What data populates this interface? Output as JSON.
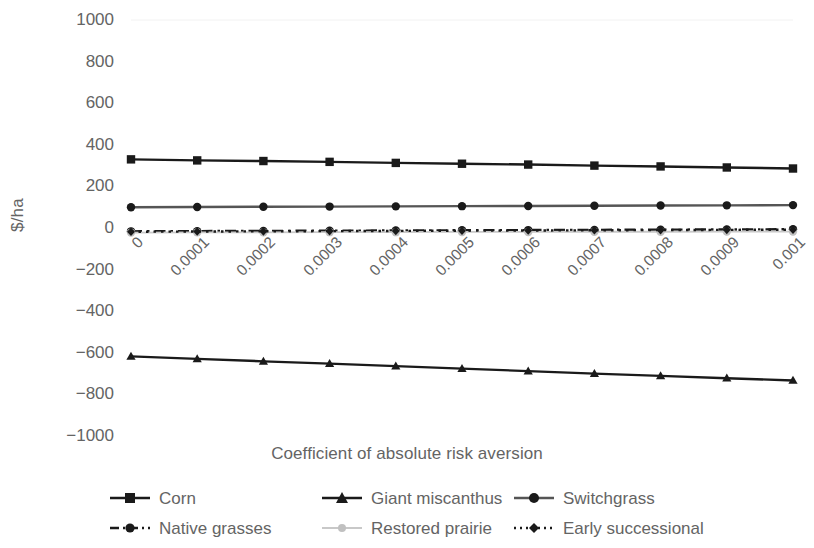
{
  "chart_data": {
    "type": "line",
    "title": "",
    "xlabel": "Coefficient of absolute risk aversion",
    "ylabel": "$/ha",
    "x": [
      0,
      0.0001,
      0.0002,
      0.0003,
      0.0004,
      0.0005,
      0.0006,
      0.0007,
      0.0008,
      0.0009,
      0.001
    ],
    "x_tick_labels": [
      "0",
      "0.0001",
      "0.0002",
      "0.0003",
      "0.0004",
      "0.0005",
      "0.0006",
      "0.0007",
      "0.0008",
      "0.0009",
      "0.001"
    ],
    "y_tick_labels": [
      "1000",
      "800",
      "600",
      "400",
      "200",
      "0",
      "-200",
      "-400",
      "-600",
      "-800",
      "-1000"
    ],
    "y_ticks": [
      1000,
      800,
      600,
      400,
      200,
      0,
      -200,
      -400,
      -600,
      -800,
      -1000
    ],
    "ylim": [
      -1000,
      1000
    ],
    "xlim": [
      0,
      0.001
    ],
    "grid": false,
    "legend_position": "bottom",
    "series": [
      {
        "name": "Corn",
        "marker": "square",
        "line_style": "solid",
        "color": "#1a1a1a",
        "values": [
          330,
          325,
          322,
          318,
          313,
          309,
          305,
          300,
          296,
          291,
          286
        ]
      },
      {
        "name": "Giant miscanthus",
        "marker": "triangle",
        "line_style": "solid",
        "color": "#1a1a1a",
        "values": [
          -617,
          -629,
          -641,
          -652,
          -664,
          -676,
          -688,
          -700,
          -711,
          -722,
          -733
        ]
      },
      {
        "name": "Switchgrass",
        "marker": "circle",
        "line_style": "solid",
        "color": "#555555",
        "values": [
          100,
          101,
          102,
          103,
          104,
          105,
          106,
          107,
          108,
          109,
          110
        ]
      },
      {
        "name": "Native grasses",
        "marker": "circle",
        "line_style": "dashdot",
        "color": "#1a1a1a",
        "values": [
          -16,
          -15,
          -14,
          -13,
          -12,
          -11,
          -10,
          -9,
          -8,
          -7,
          -6
        ]
      },
      {
        "name": "Restored prairie",
        "marker": "circle",
        "line_style": "solid",
        "color": "#c8c8c8",
        "values": [
          -22,
          -21,
          -21,
          -20,
          -20,
          -19,
          -19,
          -18,
          -18,
          -17,
          -17
        ]
      },
      {
        "name": "Early successional",
        "marker": "diamond",
        "line_style": "dotted",
        "color": "#1a1a1a",
        "values": [
          -18,
          -17,
          -16,
          -15,
          -14,
          -13,
          -12,
          -11,
          -10,
          -9,
          -8
        ]
      }
    ]
  },
  "axis": {
    "y_title": "$/ha",
    "x_title": "Coefficient of absolute risk aversion"
  },
  "legend": {
    "items": [
      {
        "label": "Corn"
      },
      {
        "label": "Giant miscanthus"
      },
      {
        "label": "Switchgrass"
      },
      {
        "label": "Native grasses"
      },
      {
        "label": "Restored prairie"
      },
      {
        "label": "Early successional"
      }
    ]
  }
}
